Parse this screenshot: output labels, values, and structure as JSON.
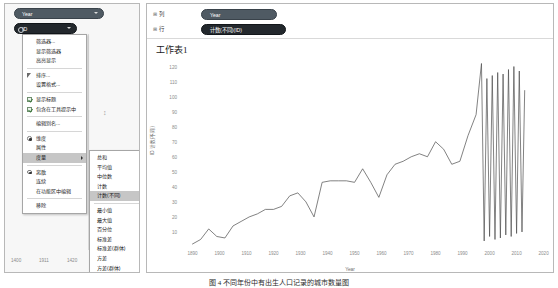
{
  "app": {
    "caption": "图 4   不同年份中有出生人口记录的城市数量图"
  },
  "left_panel": {
    "pills": [
      {
        "label": "Year",
        "type": "dimension"
      },
      {
        "label": "ID",
        "type": "measure"
      }
    ],
    "context_menu": [
      {
        "label": "筛选器...",
        "marker": "none",
        "submenu": false,
        "selected": false
      },
      {
        "label": "显示筛选器",
        "marker": "none",
        "submenu": false,
        "selected": false
      },
      {
        "label": "高亮显示",
        "marker": "none",
        "submenu": false,
        "selected": false
      },
      {
        "label": "排序...",
        "marker": "sort",
        "submenu": false,
        "selected": false
      },
      {
        "label": "设置格式...",
        "marker": "none",
        "submenu": false,
        "selected": false
      },
      {
        "label": "显示标题",
        "marker": "check",
        "submenu": false,
        "selected": false
      },
      {
        "label": "包含在工具提示中",
        "marker": "check",
        "submenu": false,
        "selected": false
      },
      {
        "label": "编辑别名...",
        "marker": "none",
        "submenu": false,
        "selected": false
      },
      {
        "label": "维度",
        "marker": "radio-on",
        "submenu": false,
        "selected": false
      },
      {
        "label": "属性",
        "marker": "none",
        "submenu": false,
        "selected": false
      },
      {
        "label": "度量",
        "marker": "none",
        "submenu": true,
        "selected": true
      },
      {
        "label": "离散",
        "marker": "radio-on",
        "submenu": false,
        "selected": false
      },
      {
        "label": "连续",
        "marker": "none",
        "submenu": false,
        "selected": false
      },
      {
        "label": "在功能区中编辑",
        "marker": "none",
        "submenu": false,
        "selected": false
      },
      {
        "label": "移除",
        "marker": "none",
        "submenu": false,
        "selected": false
      }
    ],
    "sub_menu": [
      {
        "label": "总和",
        "submenu": false,
        "selected": false
      },
      {
        "label": "平均值",
        "submenu": false,
        "selected": false
      },
      {
        "label": "中位数",
        "submenu": false,
        "selected": false
      },
      {
        "label": "计数",
        "submenu": false,
        "selected": false
      },
      {
        "label": "计数(不同)",
        "submenu": false,
        "selected": true
      },
      {
        "label": "最小值",
        "submenu": false,
        "selected": false
      },
      {
        "label": "最大值",
        "submenu": false,
        "selected": false
      },
      {
        "label": "百分位",
        "submenu": true,
        "selected": false
      },
      {
        "label": "标准差",
        "submenu": false,
        "selected": false
      },
      {
        "label": "标准差(群体)",
        "submenu": false,
        "selected": false
      },
      {
        "label": "方差",
        "submenu": false,
        "selected": false
      },
      {
        "label": "方差(群体)",
        "submenu": false,
        "selected": false
      }
    ],
    "axis_ticks": [
      "1400",
      "1911",
      "1420"
    ],
    "caret_mark": "↕"
  },
  "right_panel": {
    "shelves": [
      {
        "name": "列",
        "pill": "Year"
      },
      {
        "name": "行",
        "pill": "计数(不同)(ID)"
      }
    ],
    "worksheet_title": "工作表1"
  },
  "chart_data": {
    "type": "line",
    "title": "工作表1",
    "xlabel": "Year",
    "ylabel": "ID 计数(不同)",
    "xlim": [
      1885,
      2022
    ],
    "ylim": [
      0,
      125
    ],
    "grid": false,
    "legend": "none",
    "line_color": "#4c4c4c",
    "xticks": [
      1890,
      1900,
      1910,
      1920,
      1930,
      1940,
      1950,
      1960,
      1970,
      1980,
      1990,
      2000,
      2010,
      2020
    ],
    "yticks": [
      0,
      10,
      20,
      30,
      40,
      50,
      60,
      70,
      80,
      90,
      100,
      110,
      120
    ],
    "x": [
      1890,
      1893,
      1896,
      1899,
      1902,
      1905,
      1908,
      1911,
      1914,
      1917,
      1920,
      1923,
      1926,
      1929,
      1932,
      1935,
      1938,
      1941,
      1944,
      1947,
      1950,
      1953,
      1956,
      1959,
      1962,
      1965,
      1968,
      1971,
      1974,
      1977,
      1980,
      1983,
      1986,
      1989,
      1992,
      1995,
      1996,
      1997,
      1998,
      1999,
      2000,
      2001,
      2002,
      2003,
      2004,
      2005,
      2006,
      2007,
      2008,
      2009,
      2010,
      2011,
      2012,
      2013
    ],
    "values": [
      2,
      5,
      12,
      7,
      6,
      14,
      17,
      20,
      22,
      25,
      25,
      27,
      34,
      36,
      30,
      20,
      43,
      44,
      44,
      44,
      43,
      52,
      43,
      33,
      48,
      55,
      57,
      60,
      62,
      60,
      70,
      65,
      55,
      57,
      74,
      88,
      105,
      122,
      4,
      112,
      7,
      114,
      5,
      116,
      6,
      115,
      8,
      118,
      7,
      120,
      9,
      117,
      10,
      104
    ]
  }
}
